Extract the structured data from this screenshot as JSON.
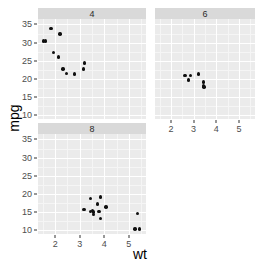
{
  "chart_data": {
    "type": "scatter",
    "title": "",
    "xlabel": "wt",
    "ylabel": "mpg",
    "facet_variable": "cyl",
    "facet_layout": "wrap-2-cols",
    "grid": true,
    "legend": "none",
    "xlim": [
      1.3,
      5.7
    ],
    "ylim": [
      9.0,
      36.5
    ],
    "xticks": [
      2,
      3,
      4,
      5
    ],
    "yticks": [
      10,
      15,
      20,
      25,
      30,
      35
    ],
    "xtick_labels": [
      "2",
      "3",
      "4",
      "5"
    ],
    "ytick_labels": [
      "10",
      "15",
      "20",
      "25",
      "30",
      "35"
    ],
    "point_color": "#101010",
    "panel_background": "#ebebeb",
    "strip_background": "#d9d9d9",
    "gridline_color": "#ffffff",
    "panels": [
      {
        "strip_label": "4",
        "facet_value": 4,
        "x": [
          2.32,
          3.19,
          3.15,
          2.2,
          1.615,
          1.835,
          2.465,
          1.935,
          2.14,
          1.513,
          2.78
        ],
        "y": [
          22.8,
          24.4,
          22.8,
          32.4,
          30.4,
          33.9,
          21.5,
          27.3,
          26.0,
          30.4,
          21.4
        ],
        "n": 11
      },
      {
        "strip_label": "6",
        "facet_value": 6,
        "x": [
          2.62,
          2.875,
          3.215,
          3.44,
          3.44,
          3.46,
          2.77
        ],
        "y": [
          21.0,
          21.0,
          21.4,
          18.1,
          19.2,
          17.8,
          19.7
        ],
        "n": 7
      },
      {
        "strip_label": "8",
        "facet_value": 8,
        "x": [
          3.44,
          3.57,
          4.07,
          3.73,
          3.78,
          5.25,
          5.424,
          5.345,
          3.52,
          3.435,
          3.84,
          3.845,
          3.17,
          3.57
        ],
        "y": [
          18.7,
          14.3,
          16.4,
          17.3,
          15.2,
          10.4,
          10.4,
          14.7,
          15.5,
          15.2,
          13.3,
          19.2,
          15.8,
          15.0
        ],
        "n": 14
      }
    ]
  },
  "axes": {
    "y_title": "mpg",
    "x_title": "wt"
  }
}
